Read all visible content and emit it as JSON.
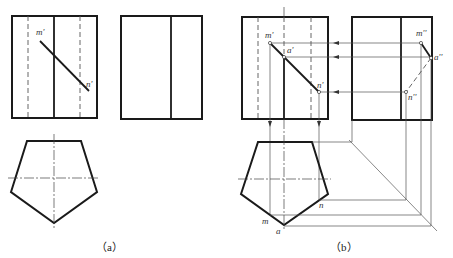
{
  "figure_a": {
    "caption": "（a）",
    "front_view_labels": {
      "m": "m'",
      "n": "n'"
    },
    "side_view_labels": {}
  },
  "figure_b": {
    "caption": "（b）",
    "front_view_labels": {
      "m": "m'",
      "a": "a'",
      "n": "n'"
    },
    "side_view_labels": {
      "m": "m''",
      "a": "a''",
      "n": "n''"
    },
    "top_view_labels": {
      "m": "m",
      "a": "a",
      "n": "n"
    }
  }
}
